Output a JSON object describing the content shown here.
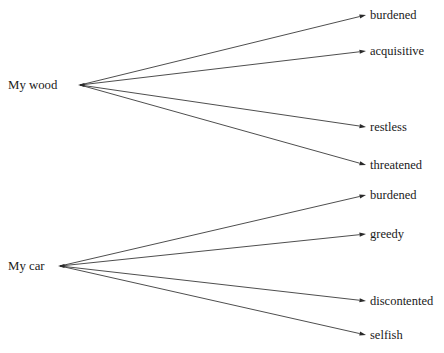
{
  "diagram": {
    "type": "node-link-association-map",
    "background_color": "#ffffff",
    "line_color": "#3a3a3a",
    "text_color": "#1a1a1a",
    "clusters": [
      {
        "id": "my-wood",
        "root_label": "My wood",
        "root_x": 80,
        "root_y": 85,
        "root_text_x": 8,
        "leaves": [
          {
            "label": "burdened",
            "x": 370,
            "y": 15,
            "tip_x": 366,
            "tip_y": 15
          },
          {
            "label": "acquisitive",
            "x": 370,
            "y": 51,
            "tip_x": 366,
            "tip_y": 51
          },
          {
            "label": "restless",
            "x": 370,
            "y": 127,
            "tip_x": 366,
            "tip_y": 127
          },
          {
            "label": "threatened",
            "x": 370,
            "y": 165,
            "tip_x": 366,
            "tip_y": 165
          }
        ]
      },
      {
        "id": "my-car",
        "root_label": "My car",
        "root_x": 60,
        "root_y": 266,
        "root_text_x": 8,
        "leaves": [
          {
            "label": "burdened",
            "x": 370,
            "y": 195,
            "tip_x": 366,
            "tip_y": 195
          },
          {
            "label": "greedy",
            "x": 370,
            "y": 234,
            "tip_x": 366,
            "tip_y": 234
          },
          {
            "label": "discontented",
            "x": 370,
            "y": 301,
            "tip_x": 366,
            "tip_y": 301
          },
          {
            "label": "selfish",
            "x": 370,
            "y": 335,
            "tip_x": 366,
            "tip_y": 335
          }
        ]
      }
    ]
  }
}
